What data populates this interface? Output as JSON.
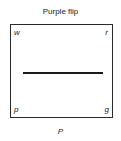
{
  "title": "Purple flip",
  "corners": {
    "top_left": "w",
    "top_right": "r",
    "bottom_left": "p",
    "bottom_right": "g"
  },
  "caption": "P"
}
